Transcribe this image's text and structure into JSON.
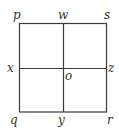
{
  "diagram": {
    "type": "square-with-midlines",
    "stroke_color": "#3a3a3a",
    "label_color": "#333333",
    "square": {
      "left": 19.5,
      "top": 23.5,
      "right": 106.5,
      "bottom": 112
    },
    "midlines": {
      "vertical_x": 63.5,
      "horizontal_y": 68.5
    },
    "labels": {
      "p": "p",
      "w": "w",
      "s": "s",
      "x": "x",
      "o": "o",
      "z": "z",
      "q": "q",
      "y": "y",
      "r": "r"
    }
  }
}
